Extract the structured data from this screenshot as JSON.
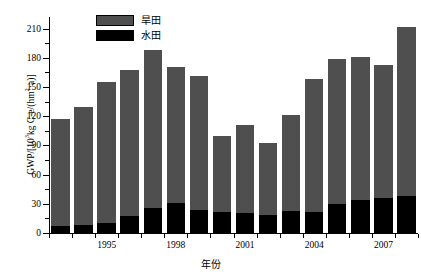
{
  "chart_data": {
    "type": "bar",
    "subtype": "stacked",
    "title": "",
    "xlabel": "年份",
    "ylabel": "GWP/[10³kg C-e/(hm²·a)]",
    "ylabel_parts": {
      "prefix": "GWP/[10",
      "exponent": "3",
      "suffix_a": "kg C-e/(hm",
      "exponent2": "2",
      "suffix_b": "·a)]"
    },
    "categories": [
      "1993",
      "1994",
      "1995",
      "1996",
      "1997",
      "1998",
      "1999",
      "2000",
      "2001",
      "2002",
      "2003",
      "2004",
      "2005",
      "2006",
      "2007",
      "2008"
    ],
    "x_tick_labels": [
      "1995",
      "1998",
      "2001",
      "2004",
      "2007"
    ],
    "x_tick_categories": [
      "1995",
      "1998",
      "2001",
      "2004",
      "2007"
    ],
    "y_tick_labels": [
      "0",
      "30",
      "60",
      "90",
      "120",
      "150",
      "180",
      "210"
    ],
    "y_tick_values": [
      0,
      30,
      60,
      90,
      120,
      150,
      180,
      210
    ],
    "ylim": [
      0,
      222
    ],
    "y_minor_step": 15,
    "grid": false,
    "legend_position": "top-center",
    "series": [
      {
        "name": "水田",
        "name_en": "paddy-field",
        "color": "#000000",
        "values": [
          7,
          8,
          10,
          17,
          26,
          31,
          24,
          22,
          21,
          19,
          23,
          22,
          30,
          34,
          36,
          38
        ]
      },
      {
        "name": "旱田",
        "name_en": "dry-field",
        "color": "#4f4f4f",
        "values": [
          110,
          122,
          145,
          151,
          162,
          140,
          137,
          78,
          90,
          74,
          98,
          136,
          149,
          147,
          137,
          174
        ]
      }
    ],
    "totals": [
      117,
      130,
      155,
      168,
      188,
      171,
      161,
      100,
      111,
      93,
      121,
      158,
      179,
      181,
      173,
      212
    ]
  },
  "legend": {
    "items": [
      {
        "label": "旱田",
        "color": "#4f4f4f"
      },
      {
        "label": "水田",
        "color": "#000000"
      }
    ]
  }
}
